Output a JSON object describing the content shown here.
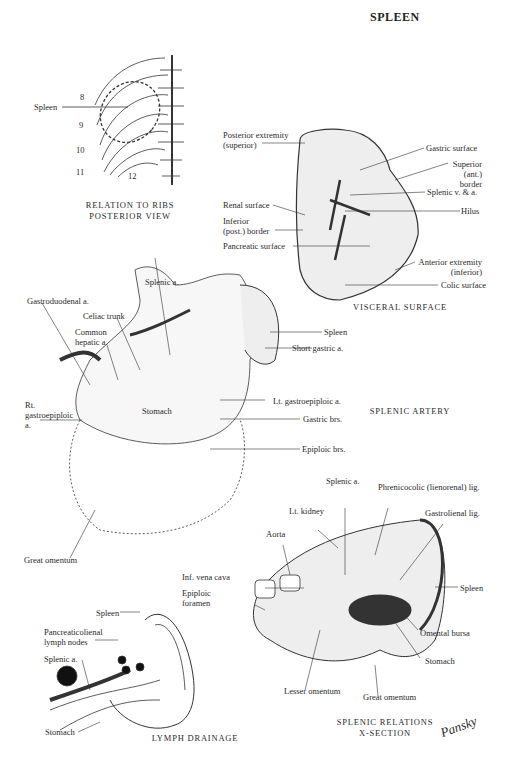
{
  "title": "SPLEEN",
  "panels": {
    "ribs": {
      "caption_line1": "RELATION TO RIBS",
      "caption_line2": "POSTERIOR VIEW",
      "labels": {
        "spleen": "Spleen",
        "r8": "8",
        "r9": "9",
        "r10": "10",
        "r11": "11",
        "r12": "12"
      }
    },
    "visceral": {
      "caption": "VISCERAL SURFACE",
      "labels": {
        "posterior_extremity": "Posterior extremity\n(superior)",
        "gastric_surface": "Gastric surface",
        "superior_border": "Superior\n(ant.) border",
        "splenic_va": "Splenic v. & a.",
        "hilus": "Hilus",
        "renal_surface": "Renal surface",
        "inferior_border": "Inferior\n(post.) border",
        "pancreatic_surface": "Pancreatic surface",
        "anterior_extremity": "Anterior extremity\n(inferior)",
        "colic_surface": "Colic surface"
      }
    },
    "artery": {
      "caption": "SPLENIC ARTERY",
      "labels": {
        "splenic_a": "Splenic a.",
        "gastroduodenal": "Gastroduodenal a.",
        "celiac": "Celiac trunk",
        "common_hepatic": "Common\nhepatic a.",
        "rt_gastroepiploic": "Rt.\ngastroepiploic\na.",
        "stomach": "Stomach",
        "spleen": "Spleen",
        "short_gastric": "Short gastric a.",
        "lt_gastroepiploic": "Lt. gastroepiploic a.",
        "gastric_brs": "Gastric brs.",
        "epiploic_brs": "Epiploic brs.",
        "great_omentum": "Great omentum"
      }
    },
    "xsection": {
      "caption_line1": "SPLENIC RELATIONS",
      "caption_line2": "X-SECTION",
      "labels": {
        "splenic_a": "Splenic a.",
        "phrenicocolic": "Phrenicocolic (lienorenal) lig.",
        "lt_kidney": "Lt. kidney",
        "gastrolienal": "Gastrolienal lig.",
        "aorta": "Aorta",
        "inf_vena_cava": "Inf. vena cava",
        "epiploic_foramen": "Epiploic\nforamen",
        "spleen": "Spleen",
        "omental_bursa": "Omental bursa",
        "stomach": "Stomach",
        "lesser_omentum": "Lesser omentum",
        "great_omentum": "Great omentum"
      }
    },
    "lymph": {
      "caption": "LYMPH DRAINAGE",
      "labels": {
        "spleen": "Spleen",
        "nodes": "Pancreaticolienal\nlymph nodes",
        "splenic_a": "Splenic a.",
        "stomach": "Stomach"
      }
    }
  },
  "signature": "Pansky"
}
